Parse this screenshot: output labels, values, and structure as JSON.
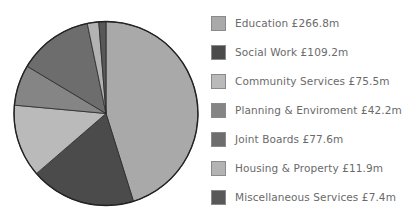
{
  "chart_data": {
    "type": "pie",
    "title": "",
    "start_angle_deg": 0,
    "direction": "clockwise",
    "categories": [
      "Education",
      "Social Work",
      "Community Services",
      "Planning & Enviroment",
      "Joint Boards",
      "Housing & Property",
      "Miscellaneous Services"
    ],
    "values": [
      266.8,
      109.2,
      75.5,
      42.2,
      77.6,
      11.9,
      7.4
    ],
    "unit": "£m",
    "colors": [
      "#a9a9a9",
      "#4b4b4b",
      "#bababa",
      "#858585",
      "#6d6d6d",
      "#b3b3b3",
      "#585858"
    ],
    "legend_position": "right",
    "legend": [
      "Education £266.8m",
      "Social Work £109.2m",
      "Community Services £75.5m",
      "Planning & Enviroment £42.2m",
      "Joint Boards £77.6m",
      "Housing & Property £11.9m",
      "Miscellaneous Services £7.4m"
    ]
  },
  "style": {
    "outline_color": "#222222",
    "pie_center": [
      106,
      113.5
    ],
    "pie_radius": 92
  }
}
